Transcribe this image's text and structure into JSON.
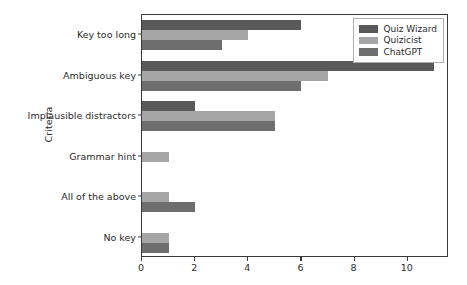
{
  "chart_data": {
    "type": "bar",
    "orientation": "horizontal",
    "title": "",
    "xlabel": "",
    "ylabel": "Criteria",
    "categories": [
      "Key too long",
      "Ambiguous key",
      "Implausible distractors",
      "Grammar hint",
      "All of the above",
      "No key"
    ],
    "series": [
      {
        "name": "Quiz Wizard",
        "color": "#595959",
        "values": [
          6,
          11,
          2,
          0,
          0,
          0
        ]
      },
      {
        "name": "Quizicist",
        "color": "#a6a6a6",
        "values": [
          4,
          7,
          5,
          1,
          1,
          1
        ]
      },
      {
        "name": "ChatGPT",
        "color": "#6e6e6e",
        "values": [
          3,
          6,
          5,
          0,
          2,
          1
        ]
      }
    ],
    "xlim": [
      0,
      11.55
    ],
    "xticks": [
      0,
      2,
      4,
      6,
      8,
      10
    ],
    "xtick_labels": [
      "0",
      "2",
      "4",
      "6",
      "8",
      "10"
    ],
    "grid": false,
    "legend_position": "upper right",
    "legend_entries": [
      "Quiz Wizard",
      "Quizicist",
      "ChatGPT"
    ],
    "axis_color": "#3a3a3a",
    "text_color": "#2b2b2b",
    "background": "#ffffff"
  }
}
